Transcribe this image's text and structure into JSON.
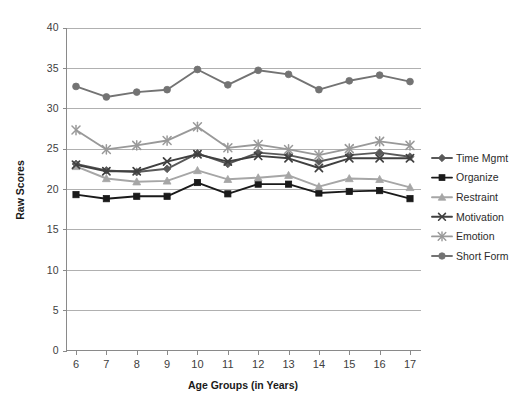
{
  "chart_data": {
    "type": "line",
    "title": "",
    "xlabel": "Age Groups (in Years)",
    "ylabel": "Raw Scores",
    "categories": [
      6,
      7,
      8,
      9,
      10,
      11,
      12,
      13,
      14,
      15,
      16,
      17
    ],
    "xtick_labels": [
      "6",
      "7",
      "8",
      "9",
      "10",
      "11",
      "12",
      "13",
      "14",
      "15",
      "16",
      "17"
    ],
    "ytick_labels": [
      "0",
      "5",
      "10",
      "15",
      "20",
      "25",
      "30",
      "35",
      "40"
    ],
    "ylim": [
      0,
      40
    ],
    "ytick_step": 5,
    "grid": "horizontal",
    "legend_position": "right",
    "series": [
      {
        "name": "Time Mgmt",
        "color": "#595959",
        "marker": "diamond",
        "values": [
          23.1,
          22.3,
          22.1,
          22.5,
          24.4,
          23.1,
          24.5,
          24.2,
          23.4,
          24.2,
          24.5,
          24.0
        ]
      },
      {
        "name": "Organize",
        "color": "#1a1a1a",
        "marker": "square",
        "values": [
          19.3,
          18.8,
          19.1,
          19.1,
          20.8,
          19.4,
          20.6,
          20.6,
          19.5,
          19.7,
          19.8,
          18.8
        ]
      },
      {
        "name": "Restraint",
        "color": "#a6a6a6",
        "marker": "triangle",
        "values": [
          22.8,
          21.3,
          20.9,
          21.0,
          22.3,
          21.2,
          21.4,
          21.7,
          20.3,
          21.3,
          21.2,
          20.2
        ]
      },
      {
        "name": "Motivation",
        "color": "#404040",
        "marker": "cross",
        "values": [
          23.0,
          22.2,
          22.2,
          23.4,
          24.3,
          23.4,
          24.1,
          23.8,
          22.6,
          23.8,
          23.8,
          23.8
        ]
      },
      {
        "name": "Emotion",
        "color": "#999999",
        "marker": "asterisk",
        "values": [
          27.3,
          24.9,
          25.4,
          26.0,
          27.7,
          25.1,
          25.5,
          24.9,
          24.2,
          25.0,
          25.9,
          25.4
        ]
      },
      {
        "name": "Short Form",
        "color": "#737373",
        "marker": "circle",
        "values": [
          32.7,
          31.4,
          32.0,
          32.3,
          34.8,
          32.9,
          34.7,
          34.2,
          32.3,
          33.4,
          34.1,
          33.3
        ]
      }
    ]
  },
  "legend": {
    "items": [
      {
        "label": "Time Mgmt"
      },
      {
        "label": "Organize"
      },
      {
        "label": "Restraint"
      },
      {
        "label": "Motivation"
      },
      {
        "label": "Emotion"
      },
      {
        "label": "Short Form"
      }
    ]
  }
}
